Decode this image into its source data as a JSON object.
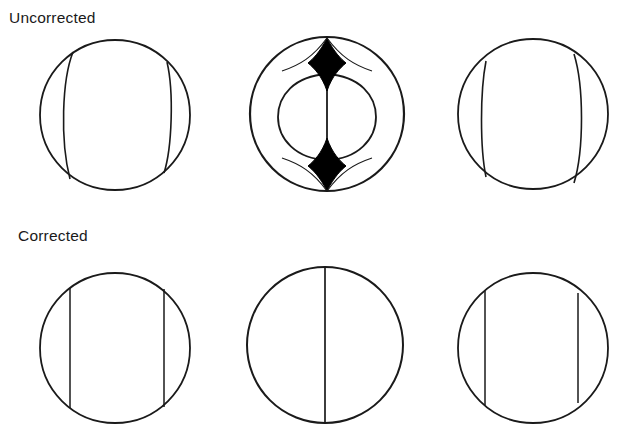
{
  "figure": {
    "background_color": "#ffffff",
    "stroke_color": "#1a1a1a",
    "fill_color": "#000000",
    "row_labels": {
      "uncorrected": "Uncorrected",
      "corrected": "Corrected"
    },
    "rows": [
      {
        "label": "Uncorrected",
        "panels": [
          {
            "name": "uncorrected-panel-1",
            "description": "circle with two inward-curving vertical arcs",
            "circle": {
              "cx": 115,
              "cy": 115,
              "r": 75
            },
            "curves": [
              {
                "name": "left-arc",
                "x1": 73,
                "y1": 52,
                "x2": 70,
                "y2": 179,
                "bow": -11
              },
              {
                "name": "right-arc",
                "x1": 167,
                "y1": 62,
                "x2": 164,
                "y2": 173,
                "bow": 7
              }
            ],
            "filled_regions": []
          },
          {
            "name": "uncorrected-panel-2",
            "description": "circle with inner oval, center line and two black astroid cusps",
            "circle": {
              "cx": 327,
              "cy": 114,
              "r": 77
            },
            "inner_ellipse": {
              "cx": 327,
              "cy": 117,
              "rx": 49,
              "ry": 43
            },
            "center_line": {
              "x": 327,
              "y1": 40,
              "y2": 191
            },
            "curves": [
              {
                "name": "upper-left-cusp-arc",
                "x1": 327,
                "y1": 38,
                "x2": 327,
                "y2": 90,
                "bow": -24
              },
              {
                "name": "upper-right-cusp-arc",
                "x1": 327,
                "y1": 38,
                "x2": 327,
                "y2": 90,
                "bow": 24
              },
              {
                "name": "lower-left-cusp-arc",
                "x1": 327,
                "y1": 190,
                "x2": 327,
                "y2": 145,
                "bow": -24
              },
              {
                "name": "lower-right-cusp-arc",
                "x1": 327,
                "y1": 190,
                "x2": 327,
                "y2": 145,
                "bow": 24
              }
            ],
            "filled_regions": [
              {
                "name": "top-astroid",
                "apex_top_y": 38,
                "apex_bottom_y": 90,
                "widest_y": 63,
                "half_width": 19
              },
              {
                "name": "bottom-astroid",
                "apex_top_y": 145,
                "apex_bottom_y": 190,
                "widest_y": 170,
                "half_width": 19
              }
            ]
          },
          {
            "name": "uncorrected-panel-3",
            "description": "circle with two outward-curving vertical arcs",
            "circle": {
              "cx": 533,
              "cy": 114,
              "r": 75
            },
            "curves": [
              {
                "name": "left-arc",
                "x1": 486,
                "y1": 61,
                "x2": 486,
                "y2": 177,
                "bow": -7
              },
              {
                "name": "right-arc",
                "x1": 574,
                "y1": 54,
                "x2": 574,
                "y2": 183,
                "bow": 11
              }
            ],
            "filled_regions": []
          }
        ]
      },
      {
        "label": "Corrected",
        "panels": [
          {
            "name": "corrected-panel-1",
            "description": "circle with two straight vertical chords",
            "circle": {
              "cx": 115,
              "cy": 348,
              "r": 75
            },
            "chords": [
              {
                "name": "left-chord",
                "x": 70,
                "y1": 288,
                "y2": 408
              },
              {
                "name": "right-chord",
                "x": 164,
                "y1": 289,
                "y2": 407
              }
            ],
            "filled_regions": []
          },
          {
            "name": "corrected-panel-2",
            "description": "circle with single vertical diameter",
            "circle": {
              "cx": 325,
              "cy": 345,
              "r": 78
            },
            "chords": [
              {
                "name": "center-chord",
                "x": 325,
                "y1": 267,
                "y2": 423
              }
            ],
            "filled_regions": []
          },
          {
            "name": "corrected-panel-3",
            "description": "circle with two straight vertical chords",
            "circle": {
              "cx": 533,
              "cy": 348,
              "r": 75
            },
            "chords": [
              {
                "name": "left-chord",
                "x": 485,
                "y1": 291,
                "y2": 405
              },
              {
                "name": "right-chord",
                "x": 578,
                "y1": 293,
                "y2": 403
              }
            ],
            "filled_regions": []
          }
        ]
      }
    ]
  }
}
